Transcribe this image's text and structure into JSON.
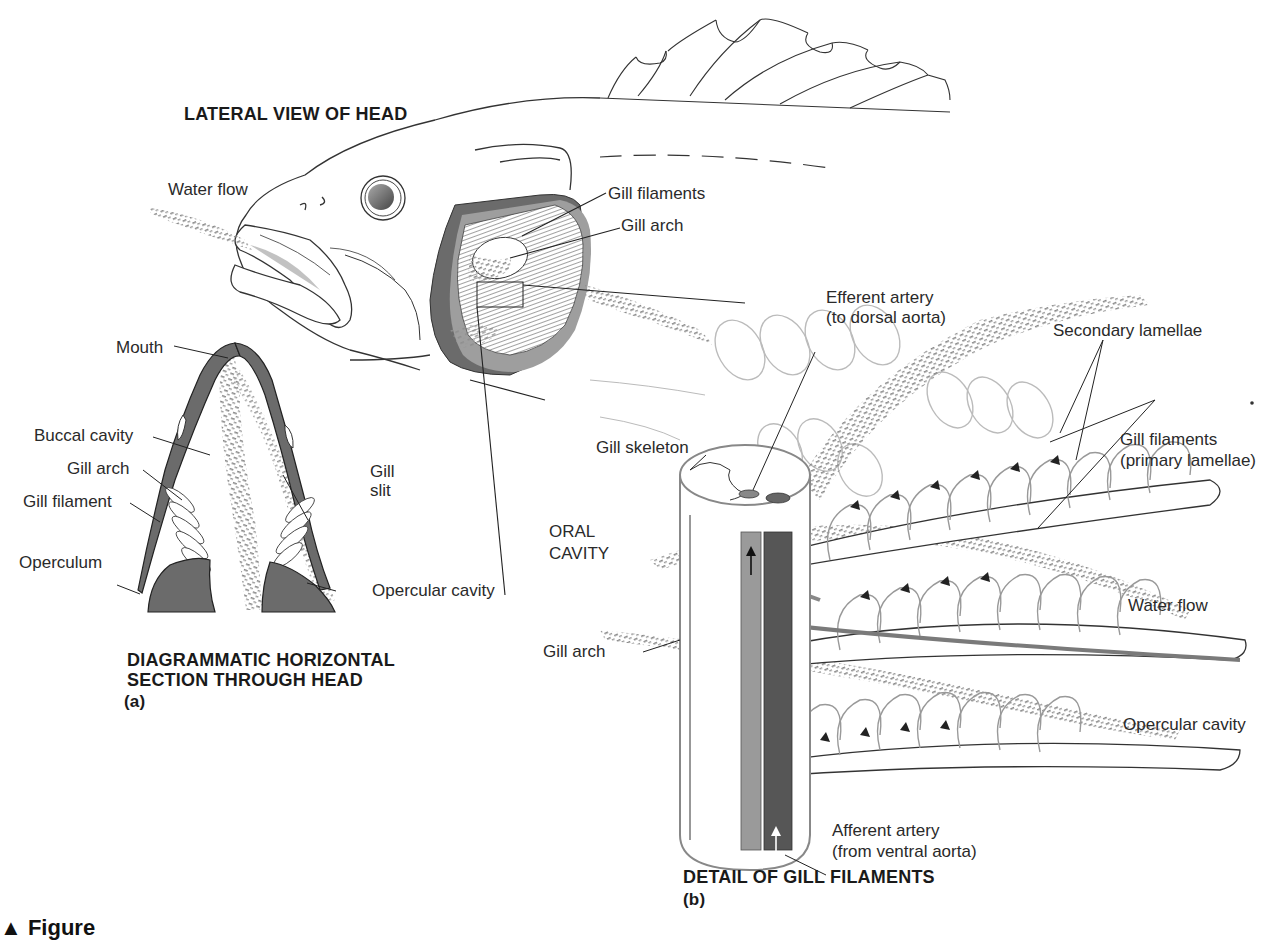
{
  "panel_a": {
    "lateral_title": "LATERAL VIEW OF HEAD",
    "section_title_line1": "DIAGRAMMATIC HORIZONTAL",
    "section_title_line2": "SECTION THROUGH HEAD",
    "panel_letter": "(a)",
    "labels": {
      "water_flow": "Water flow",
      "gill_filaments": "Gill filaments",
      "gill_arch": "Gill arch",
      "mouth": "Mouth",
      "buccal_cavity": "Buccal cavity",
      "gill_arch_section": "Gill arch",
      "gill_filament": "Gill filament",
      "operculum": "Operculum",
      "gill_slit_line1": "Gill",
      "gill_slit_line2": "slit",
      "opercular_cavity": "Opercular cavity"
    }
  },
  "panel_b": {
    "title": "DETAIL OF GILL FILAMENTS",
    "panel_letter": "(b)",
    "labels": {
      "efferent_line1": "Efferent artery",
      "efferent_line2": "(to dorsal aorta)",
      "secondary_lamellae": "Secondary lamellae",
      "gill_filaments_line1": "Gill filaments",
      "gill_filaments_line2": "(primary lamellae)",
      "gill_skeleton": "Gill skeleton",
      "oral_line1": "ORAL",
      "oral_line2": "CAVITY",
      "water_flow": "Water flow",
      "gill_arch": "Gill arch",
      "opercular_cavity": "Opercular cavity",
      "afferent_line1": "Afferent artery",
      "afferent_line2": "(from ventral aorta)"
    }
  },
  "caption": {
    "marker": "▲ Figure",
    "text": ""
  },
  "colors": {
    "dark_tissue": "#6e6e6e",
    "mid_tissue": "#9a9a9a",
    "light_tissue": "#c4c4c4",
    "water_stipple": "#8a8a8a",
    "line": "#333333"
  }
}
